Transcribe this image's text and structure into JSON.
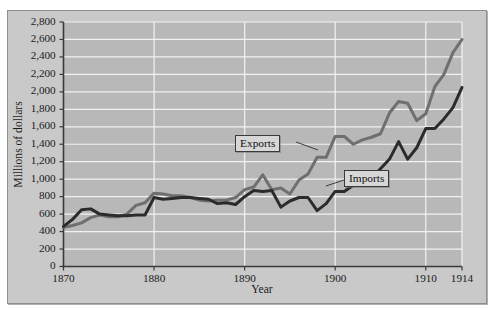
{
  "chart_data": {
    "type": "line",
    "title": "",
    "xlabel": "Year",
    "ylabel": "Millions of dollars",
    "xlim": [
      1870,
      1914
    ],
    "ylim": [
      0,
      2800
    ],
    "grid": true,
    "legend_position": "inline-annotations",
    "ytick_labels": [
      "2,800",
      "2,600",
      "2,400",
      "2,200",
      "2,000",
      "1,800",
      "1,600",
      "1,400",
      "1,200",
      "1,000",
      "800",
      "600",
      "400",
      "200",
      "0"
    ],
    "ytick_values": [
      2800,
      2600,
      2400,
      2200,
      2000,
      1800,
      1600,
      1400,
      1200,
      1000,
      800,
      600,
      400,
      200,
      0
    ],
    "xtick_labels": [
      "1870",
      "1880",
      "1890",
      "1900",
      "1910",
      "1914"
    ],
    "xtick_values": [
      1870,
      1880,
      1890,
      1900,
      1910,
      1914
    ],
    "series": [
      {
        "name": "Exports",
        "color": "#6f6f6f",
        "x": [
          1870,
          1871,
          1872,
          1873,
          1874,
          1875,
          1876,
          1877,
          1878,
          1879,
          1880,
          1881,
          1882,
          1883,
          1884,
          1885,
          1886,
          1887,
          1888,
          1889,
          1890,
          1891,
          1892,
          1893,
          1894,
          1895,
          1896,
          1897,
          1898,
          1899,
          1900,
          1901,
          1902,
          1903,
          1904,
          1905,
          1906,
          1907,
          1908,
          1909,
          1910,
          1911,
          1912,
          1913,
          1914
        ],
        "values": [
          450,
          470,
          500,
          560,
          590,
          570,
          570,
          600,
          700,
          730,
          840,
          830,
          810,
          810,
          790,
          760,
          750,
          760,
          760,
          790,
          880,
          910,
          1050,
          880,
          900,
          830,
          990,
          1060,
          1250,
          1250,
          1490,
          1490,
          1400,
          1450,
          1480,
          1520,
          1760,
          1890,
          1870,
          1670,
          1750,
          2060,
          2200,
          2450,
          2600
        ]
      },
      {
        "name": "Imports",
        "color": "#2b2b2b",
        "x": [
          1870,
          1871,
          1872,
          1873,
          1874,
          1875,
          1876,
          1877,
          1878,
          1879,
          1880,
          1881,
          1882,
          1883,
          1884,
          1885,
          1886,
          1887,
          1888,
          1889,
          1890,
          1891,
          1892,
          1893,
          1894,
          1895,
          1896,
          1897,
          1898,
          1899,
          1900,
          1901,
          1902,
          1903,
          1904,
          1905,
          1906,
          1907,
          1908,
          1909,
          1910,
          1911,
          1912,
          1913,
          1914
        ],
        "values": [
          460,
          540,
          650,
          660,
          600,
          590,
          580,
          580,
          590,
          590,
          790,
          770,
          780,
          790,
          790,
          780,
          770,
          720,
          730,
          710,
          800,
          870,
          860,
          870,
          680,
          750,
          790,
          790,
          640,
          720,
          860,
          860,
          930,
          1040,
          1010,
          1120,
          1230,
          1430,
          1230,
          1360,
          1580,
          1580,
          1690,
          1820,
          2050
        ]
      }
    ],
    "annotations": [
      {
        "text": "Exports",
        "target_series": "Exports"
      },
      {
        "text": "Imports",
        "target_series": "Imports"
      }
    ]
  },
  "axis": {
    "ylabel_text": "Millions of dollars",
    "xlabel_text": "Year"
  }
}
